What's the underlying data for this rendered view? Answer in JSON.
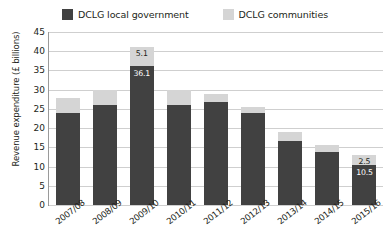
{
  "legend": {
    "items": [
      {
        "label": "DCLG local government",
        "color": "#414141",
        "swatch_name": "legend-swatch-local-government"
      },
      {
        "label": "DCLG communities",
        "color": "#d5d5d5",
        "swatch_name": "legend-swatch-communities"
      }
    ]
  },
  "axes": {
    "ylabel": "Revenue expenditure  (£ billions)",
    "yticks": [
      "0",
      "5",
      "10",
      "15",
      "20",
      "25",
      "30",
      "35",
      "40",
      "45"
    ]
  },
  "chart_data": {
    "type": "bar",
    "subtype": "stacked-vertical",
    "title": "",
    "xlabel": "",
    "ylabel": "Revenue expenditure  (£ billions)",
    "ylim": [
      0,
      45
    ],
    "ytick_step": 5,
    "grid": true,
    "legend_position": "top-center",
    "categories": [
      "2007/08",
      "2008/09",
      "2009/10",
      "2010/11",
      "2011/12",
      "2012/13",
      "2013/14",
      "2014/15",
      "2015/16"
    ],
    "series": [
      {
        "name": "DCLG local government",
        "color": "#414141",
        "values": [
          23.9,
          25.9,
          36.1,
          26.1,
          26.7,
          24.0,
          16.7,
          13.8,
          10.5
        ],
        "labels": [
          "",
          "",
          "36.1",
          "",
          "",
          "",
          "",
          "",
          "10.5"
        ]
      },
      {
        "name": "DCLG communities",
        "color": "#d5d5d5",
        "values": [
          4.0,
          4.1,
          5.1,
          3.9,
          2.2,
          1.5,
          2.2,
          1.7,
          2.5
        ],
        "labels": [
          "",
          "",
          "5.1",
          "",
          "",
          "",
          "",
          "",
          "2.5"
        ]
      }
    ],
    "totals": [
      27.9,
      30.0,
      41.2,
      30.0,
      28.9,
      25.5,
      18.9,
      15.5,
      13.0
    ]
  }
}
